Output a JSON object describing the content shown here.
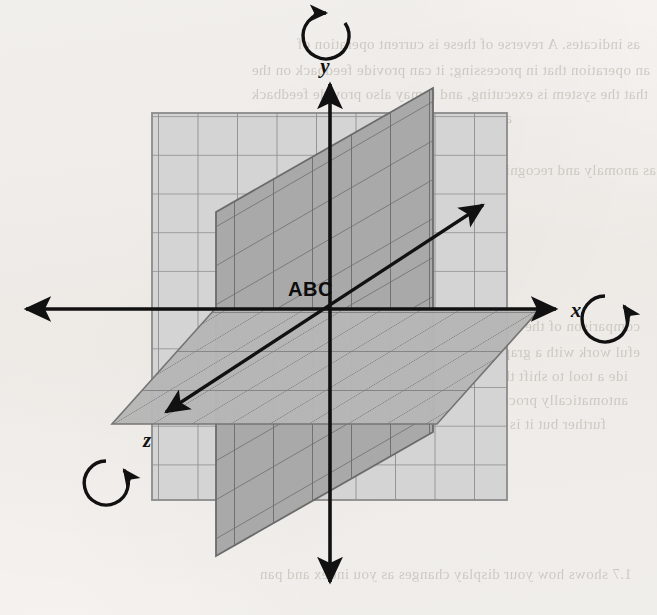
{
  "figure": {
    "origin_label": "ABC",
    "axes": [
      {
        "id": "x",
        "label": "x",
        "direction": "right",
        "arrow_positive": true,
        "arrow_negative": true,
        "rotation_icon": "rotate-clockwise-icon",
        "rotation_direction": "clockwise"
      },
      {
        "id": "y",
        "label": "y",
        "direction": "up",
        "arrow_positive": true,
        "arrow_negative": true,
        "rotation_icon": "rotate-counterclockwise-icon",
        "rotation_direction": "counterclockwise"
      },
      {
        "id": "z",
        "label": "z",
        "direction": "toward-viewer-lower-left",
        "arrow_positive": true,
        "arrow_negative": true,
        "rotation_icon": "rotate-clockwise-icon",
        "rotation_direction": "clockwise"
      }
    ],
    "planes": [
      {
        "id": "xy",
        "name": "xy-plane",
        "shade": "#d2d2d2",
        "grid_color": "#8d8d8d",
        "cells_x": 9,
        "cells_y": 10
      },
      {
        "id": "yz",
        "name": "yz-plane",
        "shade": "#a8a8a8",
        "grid_color": "#6e6e6e",
        "cells_x": 7,
        "cells_y": 12
      },
      {
        "id": "xz",
        "name": "xz-plane",
        "shade": "#b4b4b4",
        "grid_color": "#737373",
        "cells_x": 9,
        "cells_y": 7
      }
    ],
    "colors": {
      "paper": "#f4f2ef",
      "ink": "#111111",
      "plane_light": "#d2d2d2",
      "plane_mid": "#b4b4b4",
      "plane_dark": "#a8a8a8",
      "bleed_text": "#b9b3ab"
    }
  },
  "bleed_text": {
    "lines": [
      {
        "text": "as indicates. A reverse of these is current operation of",
        "x": 640,
        "y": 36,
        "size": 15,
        "bold": false
      },
      {
        "text": "an operation that in processing; it can provide feedback on the",
        "x": 650,
        "y": 62,
        "size": 15,
        "bold": false
      },
      {
        "text": "that the system is executing, and it may also provide feedback",
        "x": 648,
        "y": 86,
        "size": 15,
        "bold": false
      },
      {
        "text": "as progressed.",
        "x": 512,
        "y": 110,
        "size": 15,
        "bold": false
      },
      {
        "text": "as anomaly and recognizing the operators processes and errors",
        "x": 656,
        "y": 162,
        "size": 15,
        "bold": false
      },
      {
        "text": "that require",
        "x": 408,
        "y": 186,
        "size": 15,
        "bold": false
      },
      {
        "text": "CURSOR",
        "x": 300,
        "y": 272,
        "size": 21,
        "bold": true
      },
      {
        "text": "comparison of the cursor and the pointer to any computing",
        "x": 640,
        "y": 318,
        "size": 15,
        "bold": false
      },
      {
        "text": "eful work with a graphic display and other computing into",
        "x": 640,
        "y": 344,
        "size": 15,
        "bold": false
      },
      {
        "text": "ide a tool to shift the cursor to different categories. A",
        "x": 628,
        "y": 368,
        "size": 15,
        "bold": false
      },
      {
        "text": "antomatically proceeds through the task to simply it on",
        "x": 628,
        "y": 392,
        "size": 15,
        "bold": false
      },
      {
        "text": "further but it is for the task that only is received",
        "x": 606,
        "y": 416,
        "size": 15,
        "bold": false
      },
      {
        "text": "1.7 shows how your display changes as you index and pan",
        "x": 632,
        "y": 566,
        "size": 15,
        "bold": false
      }
    ]
  }
}
